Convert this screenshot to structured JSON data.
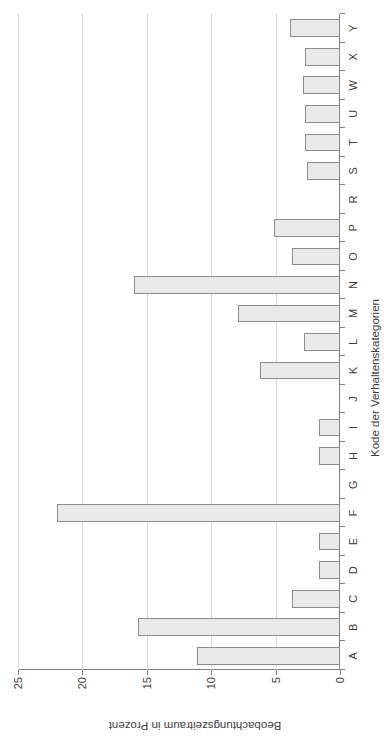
{
  "chart_data": {
    "type": "bar",
    "orientation": "vertical",
    "title": "",
    "xlabel": "Kode der Verhaltenskategorien",
    "ylabel": "Beobachtungszeitraum in Prozent",
    "ylim": [
      0,
      25
    ],
    "yticks": [
      0,
      5,
      10,
      15,
      20,
      25
    ],
    "ytick_labels": [
      "0",
      "5",
      "10",
      "15",
      "20",
      "25"
    ],
    "grid": "horizontal",
    "legend": "none",
    "bar_fill": "#e9e9e9",
    "bar_edge": "#8c8c8c",
    "categories": [
      "A",
      "B",
      "C",
      "D",
      "E",
      "F",
      "G",
      "H",
      "I",
      "J",
      "K",
      "L",
      "M",
      "N",
      "O",
      "P",
      "R",
      "S",
      "T",
      "U",
      "W",
      "X",
      "Y"
    ],
    "values": [
      11.1,
      15.7,
      3.7,
      1.6,
      1.6,
      22.0,
      0.0,
      1.6,
      1.6,
      0.0,
      6.2,
      2.8,
      7.9,
      16.0,
      3.7,
      5.1,
      0.0,
      2.6,
      2.7,
      2.7,
      2.9,
      2.7,
      3.9
    ]
  },
  "figure": {
    "rotation_note": "chart rendered rotated 90 degrees within a portrait page"
  }
}
